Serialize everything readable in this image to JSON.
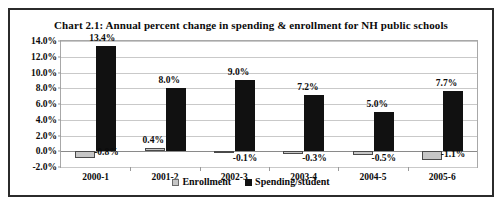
{
  "chart_data": {
    "type": "bar",
    "title": "Chart 2.1: Annual percent change in spending & enrollment for NH public schools",
    "xlabel": "",
    "ylabel": "",
    "ylim": [
      -2.0,
      14.0
    ],
    "ytick_step": 2.0,
    "yticks": [
      "14.0%",
      "12.0%",
      "10.0%",
      "8.0%",
      "6.0%",
      "4.0%",
      "2.0%",
      "0.0%",
      "-2.0%"
    ],
    "ytick_values": [
      14.0,
      12.0,
      10.0,
      8.0,
      6.0,
      4.0,
      2.0,
      0.0,
      -2.0
    ],
    "grid": true,
    "legend_position": "bottom",
    "categories": [
      "2000-1",
      "2001-2",
      "2002-3",
      "2003-4",
      "2004-5",
      "2005-6"
    ],
    "series": [
      {
        "name": "Enrollment",
        "color": "#c6c6c6",
        "values": [
          -0.8,
          0.4,
          -0.1,
          -0.3,
          -0.5,
          -1.1
        ],
        "labels": [
          "-0.8%",
          "0.4%",
          "-0.1%",
          "-0.3%",
          "-0.5%",
          "-1.1%"
        ]
      },
      {
        "name": "Spending/student",
        "color": "#111111",
        "values": [
          13.4,
          8.0,
          9.0,
          7.2,
          5.0,
          7.7
        ],
        "labels": [
          "13.4%",
          "8.0%",
          "9.0%",
          "7.2%",
          "5.0%",
          "7.7%"
        ]
      }
    ]
  },
  "legend": {
    "enrollment_label": "Enrollment",
    "spending_label": "Spending/student"
  }
}
